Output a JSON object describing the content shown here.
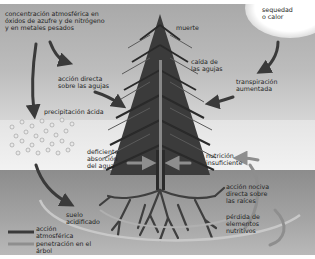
{
  "diagram": {
    "labels": {
      "concentration": "concentración atmosférica en\nóxidos de azufre y de nitrógeno\ny en metales pesados",
      "drought": "sequedad\no calor",
      "death": "muerte",
      "needle_fall": "caída de\nlas agujas",
      "direct_action_needles": "acción directa\nsobre las agujas",
      "transpiration": "transpiración\naumentada",
      "acid_precipitation": "precipitación ácida",
      "water_absorption": "deficiente\nabsorción\ndel agua",
      "insufficient_nutrition": "nutrición\ninsuficiente",
      "root_action": "acción nociva\ndirecta sobre\nlas raíces",
      "nutrient_loss": "pérdida de\nelementos\nnutritivos",
      "acidified_soil": "suelo\nacidificado"
    },
    "legend": [
      {
        "label": "acción\natmosférica",
        "color": "#3a3a3a"
      },
      {
        "label": "penetración en el\nárbol",
        "color": "#8e8e8e"
      }
    ],
    "colors": {
      "atmospheric_arrow": "#3a3a3a",
      "tree_arrow": "#8e8e8e",
      "tree": "#2e2e2e",
      "soil": "#9a9a9a",
      "sky": "#b4b4b4"
    }
  }
}
